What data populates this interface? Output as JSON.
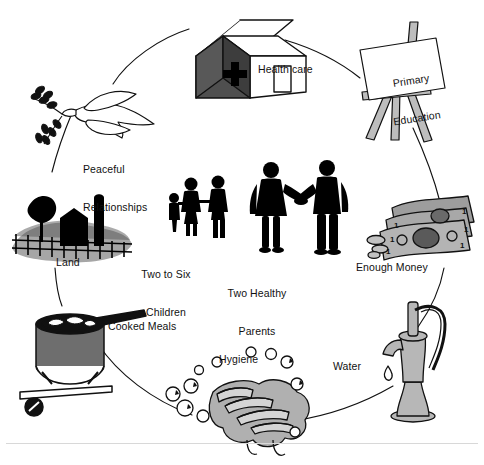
{
  "diagram": {
    "type": "cycle",
    "ring_label_count": 9,
    "center_label_count": 2,
    "colors": {
      "stroke": "#111111",
      "background": "#ffffff",
      "mid_gray": "#a3a3a3",
      "light_gray": "#c9c9c9",
      "dark_gray": "#555555",
      "silhouette": "#000000"
    }
  },
  "nodes": [
    {
      "id": "health-care",
      "label": "Health care",
      "icon": "clinic-house-icon",
      "position": "top",
      "label_x": 258,
      "label_y": 63,
      "align": "left"
    },
    {
      "id": "primary-education",
      "label": "Primary\nEducation",
      "line1": "Primary",
      "line2": "Education",
      "icon": "easel-icon",
      "position": "top-right",
      "label_x": 379,
      "label_y": 52,
      "align": "center"
    },
    {
      "id": "enough-money",
      "label": "Enough Money",
      "icon": "banknotes-icon",
      "position": "right",
      "label_x": 356,
      "label_y": 261,
      "align": "left"
    },
    {
      "id": "water",
      "label": "Water",
      "icon": "water-pump-icon",
      "position": "bottom-right",
      "label_x": 333,
      "label_y": 360,
      "align": "left"
    },
    {
      "id": "hygiene",
      "label": "Hygiene",
      "icon": "washing-hands-icon",
      "position": "bottom",
      "label_x": 219,
      "label_y": 353,
      "align": "left"
    },
    {
      "id": "cooked-meals",
      "label": "Cooked Meals",
      "icon": "cooking-pot-icon",
      "position": "bottom-left",
      "label_x": 108,
      "label_y": 320,
      "align": "left"
    },
    {
      "id": "land",
      "label": "Land",
      "icon": "farm-land-icon",
      "position": "left",
      "label_x": 56,
      "label_y": 256,
      "align": "left"
    },
    {
      "id": "peaceful-relationships",
      "label": "Peaceful\nRelationships",
      "line1": "Peaceful",
      "line2": "Relationships",
      "icon": "dove-olive-branch-icon",
      "position": "top-left",
      "label_x": 83,
      "label_y": 138,
      "align": "left"
    }
  ],
  "center_nodes": [
    {
      "id": "two-to-six-children",
      "label": "Two to Six\nChildren",
      "line1": "Two to Six",
      "line2": "Children",
      "icon": "children-silhouettes-icon",
      "label_x": 166,
      "label_y": 243,
      "align": "center"
    },
    {
      "id": "two-healthy-parents",
      "label": "Two Healthy\nParents",
      "line1": "Two Healthy",
      "line2": "Parents",
      "icon": "parents-silhouettes-icon",
      "label_x": 256,
      "label_y": 262,
      "align": "center"
    }
  ]
}
